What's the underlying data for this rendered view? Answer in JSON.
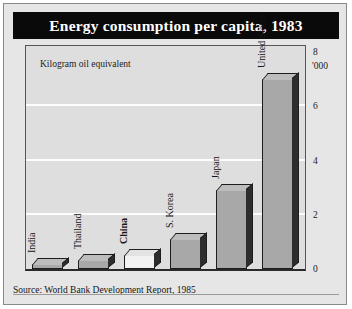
{
  "header": {
    "title": "Energy consumption per capita, 1983"
  },
  "axis": {
    "unit_label": "'000",
    "ticks": [
      "8",
      "6",
      "4",
      "2",
      "0"
    ]
  },
  "annotation": "Kilogram oil equivalent",
  "footer": {
    "source": "Source: World Bank Development Report, 1985"
  },
  "colors": {
    "title_bg": "#0a0a0a",
    "title_text": "#ffffff",
    "figure_bg": "#e6e6e6",
    "plot_bg": "#dedede",
    "gridline": "#fdfdfd",
    "bar_fill": "#a8a8a8",
    "bar_fill_light": "#f2f2f2",
    "bar_edge": "#1d1d1d",
    "bar_side": "#2d2d2d"
  },
  "chart_data": {
    "type": "bar",
    "title": "Energy consumption per capita, 1983",
    "subtitle": "Kilogram oil equivalent",
    "xlabel": "",
    "ylabel": "'000",
    "ylim": [
      0,
      8
    ],
    "yticks": [
      0,
      2,
      4,
      6,
      8
    ],
    "grid": true,
    "legend": false,
    "categories": [
      "India",
      "Thailand",
      "China",
      "S. Korea",
      "Japan",
      "United States"
    ],
    "values": [
      0.2,
      0.35,
      0.5,
      1.1,
      2.9,
      7.0
    ],
    "bar_styles": [
      "grey",
      "grey",
      "light",
      "grey",
      "grey",
      "grey"
    ],
    "label_emphasis": [
      "normal",
      "normal",
      "bold",
      "normal",
      "normal",
      "normal"
    ],
    "source": "Source: World Bank Development Report, 1985"
  }
}
